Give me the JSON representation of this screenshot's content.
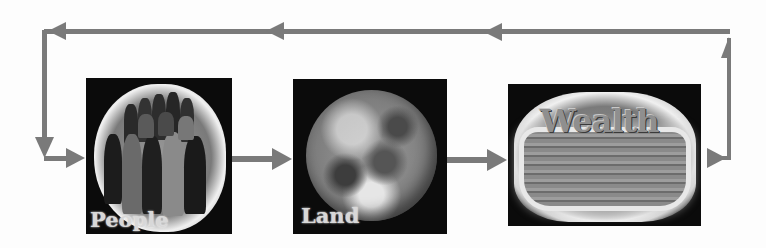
{
  "diagram": {
    "type": "cycle",
    "nodes": [
      {
        "id": "people",
        "label": "People",
        "image": "crowd-of-people"
      },
      {
        "id": "land",
        "label": "Land",
        "image": "earth-globe"
      },
      {
        "id": "wealth",
        "label": "Wealth",
        "image": "basket-with-wealth-text"
      }
    ],
    "edges": [
      {
        "from": "people",
        "to": "land"
      },
      {
        "from": "land",
        "to": "wealth"
      },
      {
        "from": "wealth",
        "to": "people",
        "route": "return-loop-over-top"
      }
    ],
    "colors": {
      "arrow": "#7a7a7a",
      "node_background": "#0b0b0b",
      "page_background": "#fdfdfd"
    }
  }
}
